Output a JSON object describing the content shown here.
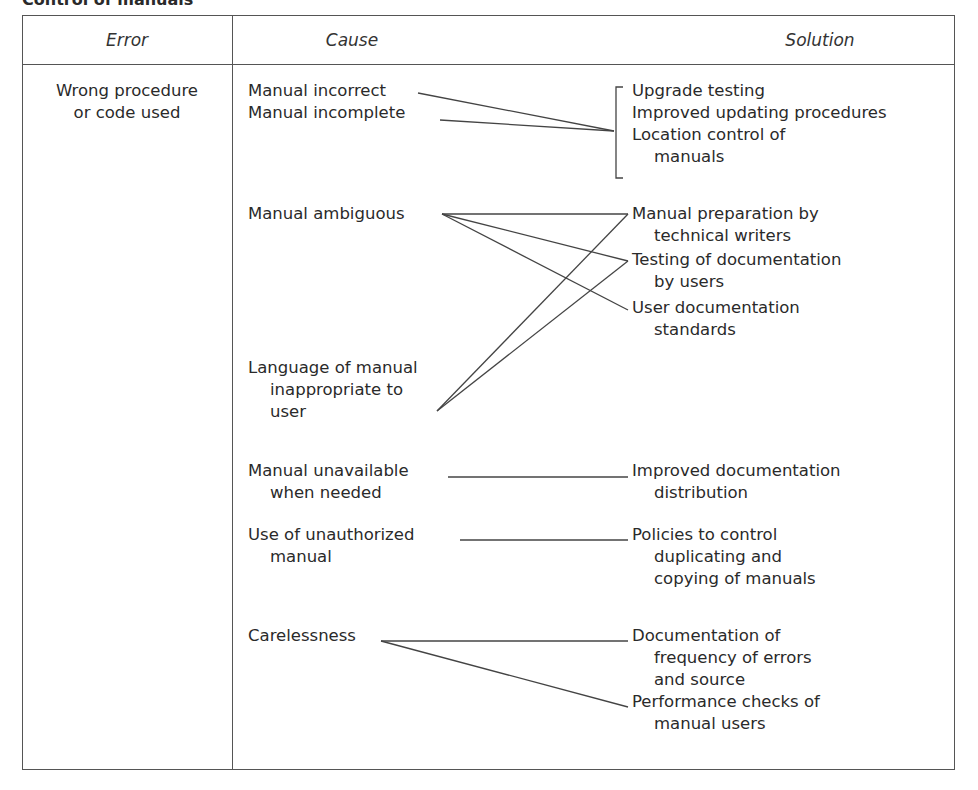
{
  "caption": "Control of manuals",
  "headers": {
    "error": "Error",
    "cause": "Cause",
    "solution": "Solution"
  },
  "error": {
    "lines": [
      "Wrong procedure",
      "or code used"
    ]
  },
  "causes": [
    {
      "id": "c1",
      "lines": [
        "Manual incorrect"
      ]
    },
    {
      "id": "c2",
      "lines": [
        "Manual incomplete"
      ]
    },
    {
      "id": "c3",
      "lines": [
        "Manual ambiguous"
      ]
    },
    {
      "id": "c4",
      "lines": [
        "Language of manual",
        "inappropriate to",
        "user"
      ]
    },
    {
      "id": "c5",
      "lines": [
        "Manual unavailable",
        "when needed"
      ]
    },
    {
      "id": "c6",
      "lines": [
        "Use of unauthorized",
        "manual"
      ]
    },
    {
      "id": "c7",
      "lines": [
        "Carelessness"
      ]
    }
  ],
  "solutions": [
    {
      "id": "s1",
      "lines": [
        "Upgrade testing"
      ]
    },
    {
      "id": "s2",
      "lines": [
        "Improved updating procedures"
      ]
    },
    {
      "id": "s3",
      "lines": [
        "Location control of",
        "manuals"
      ]
    },
    {
      "id": "s4",
      "lines": [
        "Manual preparation by",
        "technical writers"
      ]
    },
    {
      "id": "s5",
      "lines": [
        "Testing of documentation",
        "by users"
      ]
    },
    {
      "id": "s6",
      "lines": [
        "User documentation",
        "standards"
      ]
    },
    {
      "id": "s7",
      "lines": [
        "Improved documentation",
        "distribution"
      ]
    },
    {
      "id": "s8",
      "lines": [
        "Policies to control",
        "duplicating and",
        "copying of manuals"
      ]
    },
    {
      "id": "s9",
      "lines": [
        "Documentation of",
        "frequency of errors",
        "and source"
      ]
    },
    {
      "id": "s10",
      "lines": [
        "Performance checks of",
        "manual users"
      ]
    }
  ],
  "connections": [
    {
      "from": "c1",
      "to": "s1-s3 (bracket)"
    },
    {
      "from": "c2",
      "to": "s1-s3 (bracket)"
    },
    {
      "from": "c3",
      "to": "s4"
    },
    {
      "from": "c3",
      "to": "s5"
    },
    {
      "from": "c3",
      "to": "s6"
    },
    {
      "from": "c4",
      "to": "s4"
    },
    {
      "from": "c4",
      "to": "s5"
    },
    {
      "from": "c5",
      "to": "s7"
    },
    {
      "from": "c6",
      "to": "s8"
    },
    {
      "from": "c7",
      "to": "s9"
    },
    {
      "from": "c7",
      "to": "s10"
    }
  ]
}
